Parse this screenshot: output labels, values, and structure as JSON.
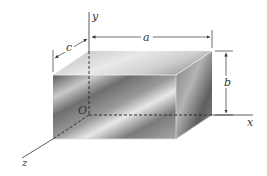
{
  "diagram": {
    "type": "rectangular-prism-with-axes",
    "axes": {
      "x_label": "x",
      "y_label": "y",
      "z_label": "z",
      "origin_label": "O"
    },
    "dimensions": {
      "a_label": "a",
      "b_label": "b",
      "c_label": "c"
    },
    "colors": {
      "box_dark": "#6b6b6b",
      "box_light": "#e6e6e6",
      "line": "#333333",
      "background": "#ffffff"
    }
  }
}
